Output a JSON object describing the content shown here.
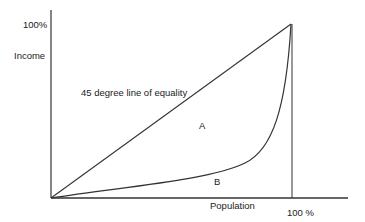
{
  "diagram": {
    "type": "lorenz-curve",
    "labels": {
      "y_top": "100%",
      "y_axis": "Income",
      "equality_line": "45 degree line of equality",
      "region_a": "A",
      "region_b": "B",
      "x_axis": "Population",
      "x_end": "100 %"
    },
    "colors": {
      "line": "#333333",
      "text": "#222222",
      "background": "#ffffff"
    },
    "geometry": {
      "origin": [
        51,
        198
      ],
      "top_corner": [
        291,
        24
      ],
      "y_axis_top": 10,
      "x_axis_right": 348
    }
  }
}
